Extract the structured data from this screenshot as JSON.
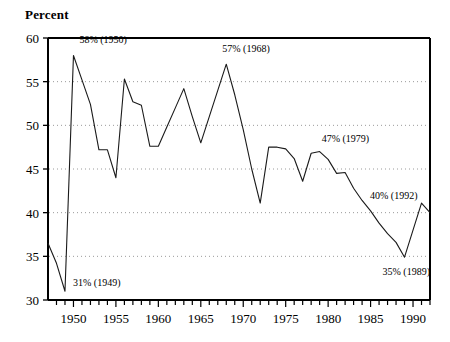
{
  "chart_data": {
    "type": "line",
    "title": "",
    "ylabel": "Percent",
    "xlabel": "",
    "ylim": [
      30,
      60
    ],
    "xlim": [
      1947,
      1992
    ],
    "grid": "horizontal-dotted",
    "legend": "none",
    "ytick_labels": [
      "30",
      "35",
      "40",
      "45",
      "50",
      "55",
      "60"
    ],
    "ytick_values": [
      30,
      35,
      40,
      45,
      50,
      55,
      60
    ],
    "xtick_labels": [
      "1950",
      "1955",
      "1960",
      "1965",
      "1970",
      "1975",
      "1980",
      "1985",
      "1990"
    ],
    "xtick_values": [
      1950,
      1955,
      1960,
      1965,
      1970,
      1975,
      1980,
      1985,
      1990
    ],
    "x": [
      1947,
      1948,
      1949,
      1950,
      1951,
      1952,
      1953,
      1954,
      1955,
      1956,
      1957,
      1958,
      1959,
      1960,
      1961,
      1962,
      1963,
      1964,
      1965,
      1966,
      1967,
      1968,
      1969,
      1970,
      1971,
      1972,
      1973,
      1974,
      1975,
      1976,
      1977,
      1978,
      1979,
      1980,
      1981,
      1982,
      1983,
      1984,
      1985,
      1986,
      1987,
      1988,
      1989,
      1990,
      1991,
      1992
    ],
    "values": [
      36.5,
      34.2,
      31.0,
      58.0,
      55.2,
      52.4,
      47.2,
      47.2,
      44.0,
      55.3,
      52.7,
      52.3,
      47.6,
      47.6,
      49.8,
      52.0,
      54.2,
      51.0,
      48.0,
      51.0,
      54.0,
      57.0,
      53.5,
      49.5,
      45.0,
      41.1,
      47.5,
      47.5,
      47.3,
      46.2,
      43.6,
      46.8,
      47.0,
      46.1,
      44.5,
      44.6,
      42.8,
      41.4,
      40.2,
      38.8,
      37.6,
      36.6,
      34.9,
      38.0,
      41.1,
      40.0
    ],
    "annotations": [
      {
        "text": "58% (1950)",
        "x": 1950,
        "y": 58,
        "dx": 6,
        "dy": -12
      },
      {
        "text": "31% (1949)",
        "x": 1949,
        "y": 31,
        "dx": 8,
        "dy": -5
      },
      {
        "text": "57% (1968)",
        "x": 1968,
        "y": 57,
        "dx": -4,
        "dy": -12
      },
      {
        "text": "47% (1979)",
        "x": 1979,
        "y": 47,
        "dx": 2,
        "dy": -10
      },
      {
        "text": "40% (1992)",
        "x": 1992,
        "y": 40,
        "dx": -60,
        "dy": -14
      },
      {
        "text": "35% (1989)",
        "x": 1989,
        "y": 34.9,
        "dx": -22,
        "dy": 18
      }
    ],
    "colors": {
      "line": "#1a1a1a",
      "axis": "#000000",
      "grid": "#9a9a9a",
      "background": "#ffffff"
    }
  }
}
